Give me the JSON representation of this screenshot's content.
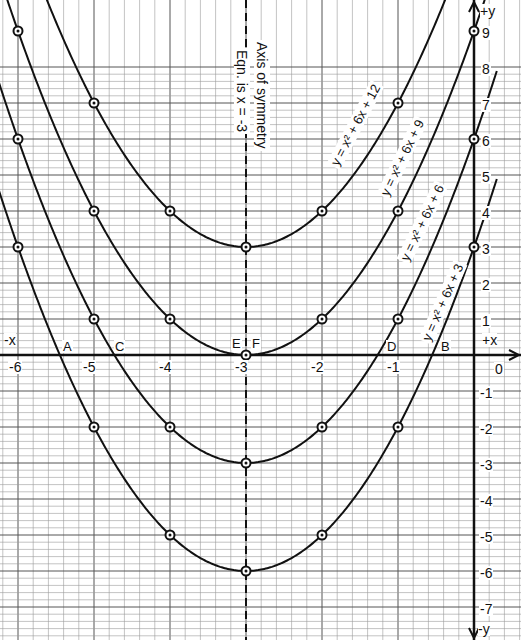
{
  "chart_data": {
    "type": "line",
    "title": "",
    "xlabel": "x",
    "ylabel": "y",
    "xlim": [
      -6,
      0.3
    ],
    "ylim": [
      -7,
      9.2
    ],
    "grid": true,
    "axis_labels": {
      "pos_x": "+x",
      "neg_x": "-x",
      "pos_y": "+y",
      "neg_y": "-y"
    },
    "x_ticks": [
      "-6",
      "-5",
      "-4",
      "-3",
      "-2",
      "-1",
      "0"
    ],
    "y_ticks": [
      "9",
      "8",
      "7",
      "6",
      "5",
      "4",
      "3",
      "2",
      "1",
      "-1",
      "-2",
      "-3",
      "-4",
      "-5",
      "-6",
      "-7"
    ],
    "axis_of_symmetry": {
      "label_1": "Axis of symmetry",
      "label_2": "Eqn.  is  x = -3",
      "x": -3
    },
    "series": [
      {
        "name": "y=x²+6x+12",
        "x": [
          -6,
          -5,
          -4,
          -3,
          -2,
          -1,
          0
        ],
        "y": [
          12,
          7,
          4,
          3,
          4,
          7,
          12
        ]
      },
      {
        "name": "y=x²+6x+9",
        "x": [
          -6,
          -5,
          -4,
          -3,
          -2,
          -1,
          0
        ],
        "y": [
          9,
          4,
          1,
          0,
          1,
          4,
          9
        ]
      },
      {
        "name": "y=x²+6x+6",
        "x": [
          -6,
          -5,
          -4,
          -3,
          -2,
          -1,
          0
        ],
        "y": [
          6,
          1,
          -2,
          -3,
          -2,
          1,
          6
        ]
      },
      {
        "name": "y=x²+6x+3",
        "x": [
          -6,
          -5,
          -4,
          -3,
          -2,
          -1,
          0
        ],
        "y": [
          3,
          -2,
          -5,
          -6,
          -5,
          -2,
          3
        ]
      }
    ],
    "annotations": [
      {
        "text": "A",
        "x": -5.45,
        "note": "root of y=x²+6x+3"
      },
      {
        "text": "B",
        "x": -0.55,
        "note": "root of y=x²+6x+3"
      },
      {
        "text": "C",
        "x": -4.73,
        "note": "root of y=x²+6x+6"
      },
      {
        "text": "D",
        "x": -1.27,
        "note": "root of y=x²+6x+6"
      },
      {
        "text": "E",
        "x": -3,
        "note": "tangent point of y=x²+6x+9"
      },
      {
        "text": "F",
        "x": -3,
        "note": "tangent point of y=x²+6x+9"
      }
    ]
  },
  "labels": {
    "curve_12": "y = x² + 6x + 12",
    "curve_9": "y = x² + 6x + 9",
    "curve_6": "y = x² + 6x + 6",
    "curve_3": "y = x² + 6x + 3"
  },
  "colors": {
    "line": "#111111",
    "grid_minor": "#9a9a9a",
    "grid_major": "#555555",
    "background": "#ffffff"
  }
}
